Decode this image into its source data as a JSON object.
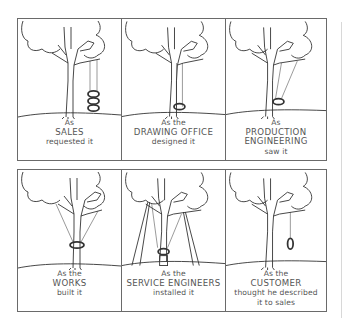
{
  "cartoon": {
    "panels": [
      {
        "line1": "As",
        "line2": "SALES",
        "line3": "requested it",
        "line4": "",
        "swing": "three-tyres-stacked"
      },
      {
        "line1": "As the",
        "line2": "DRAWING OFFICE",
        "line3": "designed it",
        "line4": "",
        "swing": "single-tyre-through-branch"
      },
      {
        "line1": "As",
        "line2": "PRODUCTION",
        "line3": "ENGINEERING",
        "line4": "saw it",
        "swing": "tyre-on-angled-rope"
      },
      {
        "line1": "As the",
        "line2": "WORKS",
        "line3": "built it",
        "line4": "",
        "swing": "tyre-around-trunk"
      },
      {
        "line1": "As the",
        "line2": "SERVICE ENGINEERS",
        "line3": "installed it",
        "line4": "",
        "swing": "tyre-propped-with-poles"
      },
      {
        "line1": "As the",
        "line2": "CUSTOMER",
        "line3": "thought he described",
        "line4": "it to sales",
        "swing": "tyre-hanging-vertical"
      }
    ],
    "colors": {
      "border": "#6a6a6a",
      "ink": "#333333",
      "caption": "#555555"
    }
  }
}
